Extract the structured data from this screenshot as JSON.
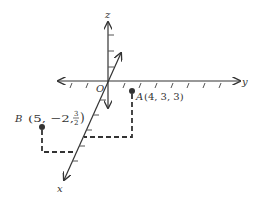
{
  "diagram": {
    "type": "3d-coordinate-axes",
    "axes": {
      "x": {
        "label": "x"
      },
      "y": {
        "label": "y"
      },
      "z": {
        "label": "z"
      },
      "origin": {
        "label": "O"
      }
    },
    "points": [
      {
        "name": "A",
        "coords_text": "(4, 3, 3)",
        "x": 4,
        "y": 3,
        "z": 3
      },
      {
        "name": "B",
        "coords_prefix": "(5, −2,",
        "frac_num": "3",
        "frac_den": "2",
        "coords_suffix": ")",
        "x": 5,
        "y": -2,
        "z": 1.5
      }
    ],
    "colors": {
      "ink": "#333333",
      "point": "#333333"
    }
  }
}
